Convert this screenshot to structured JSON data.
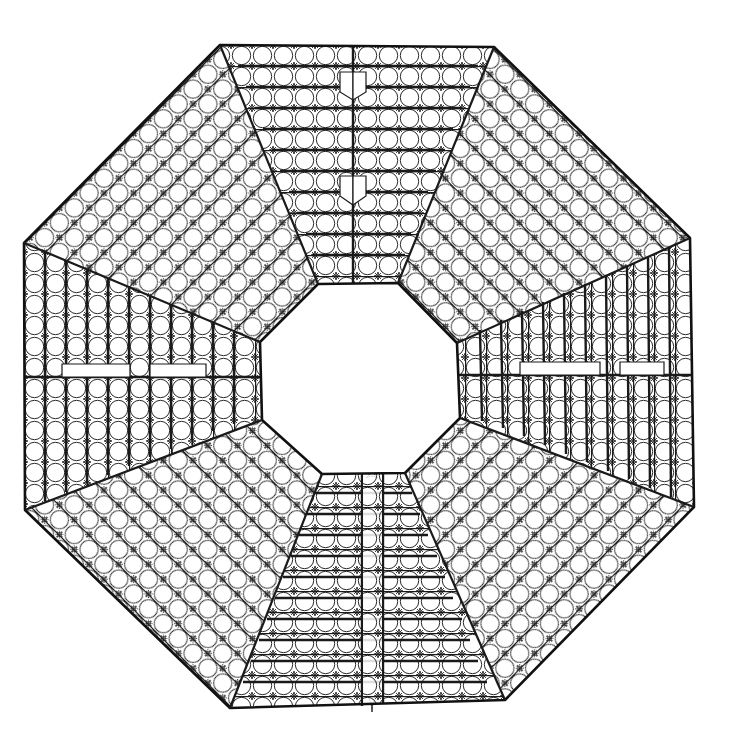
{
  "figure": {
    "background": "#ffffff",
    "stroke": "#1a1a1a",
    "thin_stroke": "#2a2a2a"
  },
  "geometry": {
    "outer_octagon": [
      [
        220,
        45
      ],
      [
        494,
        47
      ],
      [
        690,
        238
      ],
      [
        694,
        507
      ],
      [
        505,
        700
      ],
      [
        230,
        708
      ],
      [
        25,
        510
      ],
      [
        24,
        243
      ]
    ],
    "inner_octagon": [
      [
        318,
        284
      ],
      [
        398,
        283
      ],
      [
        457,
        343
      ],
      [
        460,
        418
      ],
      [
        405,
        473
      ],
      [
        322,
        474
      ],
      [
        262,
        420
      ],
      [
        260,
        342
      ]
    ],
    "cell_size": 21,
    "motifs": [
      "circle",
      "four-point-concave-star",
      "diagonal-cross"
    ]
  },
  "bands": [
    {
      "name": "top",
      "orientation": "horizontal",
      "divider_x": 353
    },
    {
      "name": "top-right",
      "orientation": "diagonal-down"
    },
    {
      "name": "right",
      "orientation": "vertical",
      "divider_y": 375
    },
    {
      "name": "bottom-right",
      "orientation": "diagonal-up"
    },
    {
      "name": "bottom",
      "orientation": "horizontal",
      "channel_x": [
        362,
        383
      ]
    },
    {
      "name": "bottom-left",
      "orientation": "diagonal-down"
    },
    {
      "name": "left",
      "orientation": "vertical",
      "divider_y": 377
    },
    {
      "name": "top-left",
      "orientation": "diagonal-up"
    }
  ]
}
